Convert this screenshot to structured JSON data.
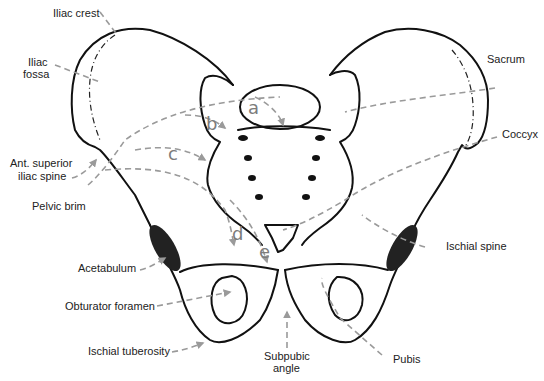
{
  "figure": {
    "colors": {
      "outline": "#111111",
      "leader_lines": "#9a9a9a",
      "letters": "#7c7c7c",
      "text": "#222222",
      "background": "#ffffff"
    }
  },
  "labels": {
    "iliac_crest": "Iliac crest",
    "iliac_fossa_1": "Iliac",
    "iliac_fossa_2": "fossa",
    "ant_sup_iliac_spine_1": "Ant. superior",
    "ant_sup_iliac_spine_2": "iliac spine",
    "pelvic_brim": "Pelvic brim",
    "acetabulum": "Acetabulum",
    "obturator_foramen": "Obturator foramen",
    "ischial_tuberosity": "Ischial tuberosity",
    "subpubic_angle_1": "Subpubic",
    "subpubic_angle_2": "angle",
    "pubis": "Pubis",
    "ischial_spine": "Ischial spine",
    "coccyx": "Coccyx",
    "sacrum": "Sacrum"
  },
  "letters": {
    "a": "a",
    "b": "b",
    "c": "c",
    "d": "d",
    "e": "e"
  }
}
